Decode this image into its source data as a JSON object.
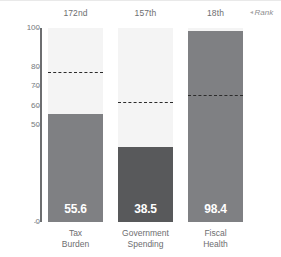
{
  "chart_data": {
    "type": "bar",
    "title": "",
    "subtitle": "",
    "xlabel": "",
    "ylabel": "",
    "ylim": [
      0,
      100
    ],
    "grid": false,
    "legend_position": "top-right",
    "categories": [
      "Tax\nBurden",
      "Government\nSpending",
      "Fiscal\nHealth"
    ],
    "values": [
      55.6,
      38.5,
      98.4
    ],
    "value_labels": [
      "55.6",
      "38.5",
      "98.4"
    ],
    "ranks": [
      "172nd",
      "157th",
      "18th"
    ],
    "rank_legend": "Rank",
    "rank_legend_arrow": "◂",
    "reference_lines": {
      "label": "world average",
      "style": "dashed",
      "values": [
        77.5,
        62.0,
        65.5
      ]
    },
    "y_ticks": [
      100,
      80,
      70,
      60,
      50,
      0
    ],
    "y_tick_labels": [
      "100",
      "80",
      "70",
      "60",
      "50",
      "0"
    ],
    "colors": {
      "bar_default": "#7f8083",
      "bar_highlight": "#58595b",
      "track": "#f4f4f4",
      "axis": "#6d6e70",
      "reference_line": "#2b2b2b",
      "value_text": "#ffffff",
      "tick_text": "#76777a",
      "label_text": "#6d6e70",
      "background": "#ffffff"
    },
    "series": [
      {
        "name": "Tax Burden",
        "value": 55.6,
        "rank": "172nd",
        "reference": 77.5,
        "color": "#7f8083"
      },
      {
        "name": "Government Spending",
        "value": 38.5,
        "rank": "157th",
        "reference": 62.0,
        "color": "#58595b"
      },
      {
        "name": "Fiscal Health",
        "value": 98.4,
        "rank": "18th",
        "reference": 65.5,
        "color": "#7f8083"
      }
    ]
  }
}
